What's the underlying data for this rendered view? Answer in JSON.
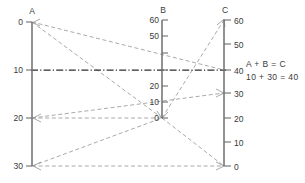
{
  "figure": {
    "type": "nomogram",
    "background_color": "#ffffff"
  },
  "axes": [
    {
      "id": "A",
      "title": "A",
      "label_side": "left",
      "direction": "descending",
      "range": [
        0,
        30
      ],
      "tick_values": [
        0,
        10,
        20,
        30
      ],
      "tick_labels": [
        "0",
        "10",
        "20",
        "30"
      ],
      "x": 32,
      "y_top": 22,
      "y_bottom": 166,
      "color": "#6e6e6e"
    },
    {
      "id": "B",
      "title": "B",
      "label_side": "left",
      "direction": "ascending",
      "range": [
        0,
        60
      ],
      "tick_values": [
        0,
        10,
        20,
        30,
        40,
        50,
        60
      ],
      "tick_labels": [
        "0",
        "10",
        "20",
        "30",
        "40",
        "50",
        "60"
      ],
      "visible_tick_labels": [
        "0",
        "10",
        "20",
        "50",
        "60"
      ],
      "x": 162,
      "y_top": 20,
      "y_bottom": 118,
      "color": "#6e6e6e"
    },
    {
      "id": "C",
      "title": "C",
      "label_side": "right",
      "direction": "ascending",
      "range": [
        0,
        60
      ],
      "tick_values": [
        0,
        10,
        20,
        30,
        40,
        50,
        60
      ],
      "tick_labels": [
        "0",
        "10",
        "20",
        "30",
        "40",
        "50",
        "60"
      ],
      "x": 224,
      "y_top": 20,
      "y_bottom": 166,
      "color": "#6e6e6e"
    }
  ],
  "construction_lines": {
    "style": "dashed",
    "color": "#9a9a9a",
    "lines": [
      {
        "name": "a0-c40",
        "from": {
          "axis": "A",
          "value": 0
        },
        "to": {
          "axis": "C",
          "value": 40
        },
        "arrow_at": "from"
      },
      {
        "name": "a0-b0",
        "from": {
          "axis": "A",
          "value": 0
        },
        "to": {
          "axis": "B",
          "value": 0
        },
        "arrow_at": "from"
      },
      {
        "name": "b0-c60",
        "from": {
          "axis": "B",
          "value": 0
        },
        "to": {
          "axis": "C",
          "value": 60
        },
        "arrow_at": "to"
      },
      {
        "name": "a20-b0-c30",
        "from": {
          "axis": "A",
          "value": 20
        },
        "to": {
          "axis": "C",
          "value": 30
        },
        "arrow_at": "both"
      },
      {
        "name": "a30-b0-c0",
        "from": {
          "axis": "A",
          "value": 30
        },
        "to": {
          "axis": "C",
          "value": 0
        },
        "arrow_at": "both"
      }
    ]
  },
  "solution_line": {
    "style": "dash-dot",
    "color": "#2e2e2e",
    "points": [
      {
        "axis": "A",
        "value": 10
      },
      {
        "axis": "B",
        "value": 30
      },
      {
        "axis": "C",
        "value": 40
      }
    ]
  },
  "annotation": {
    "equation": "A + B = C",
    "substitution": "10 + 30 = 40",
    "x": 246,
    "y_equation": 64,
    "y_substitution": 77
  }
}
